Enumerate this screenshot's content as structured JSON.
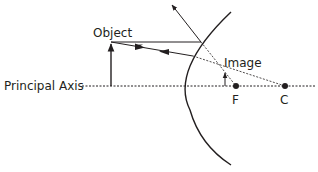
{
  "diagram": {
    "type": "convex-mirror-ray-diagram",
    "labels": {
      "object": "Object",
      "image": "Image",
      "principal_axis": "Principal Axis",
      "focus": "F",
      "center": "C"
    },
    "colors": {
      "ink": "#231f20",
      "background": "#ffffff"
    }
  }
}
